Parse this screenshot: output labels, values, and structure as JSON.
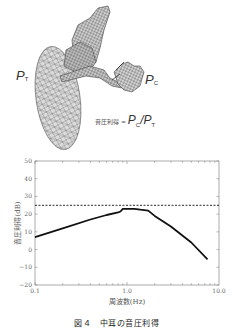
{
  "figure": {
    "caption": "図４　中耳の音圧利得",
    "model_labels": {
      "pt": {
        "main": "P",
        "sub": "T"
      },
      "pc": {
        "main": "P",
        "sub": "C"
      },
      "formula_prefix": "音圧利得 = ",
      "formula_num": {
        "main": "P",
        "sub": "C"
      },
      "formula_sep": "/",
      "formula_den": {
        "main": "P",
        "sub": "T"
      }
    }
  },
  "chart_data": {
    "type": "line",
    "title": "",
    "xlabel": "周波数(Hz)",
    "ylabel": "音圧利得(dB)",
    "xscale": "log",
    "xlim": [
      0.1,
      10.0
    ],
    "ylim": [
      -20,
      50
    ],
    "xticks": [
      "0.1",
      "1.0",
      "10.0"
    ],
    "yticks": [
      "50",
      "40",
      "30",
      "20",
      "10",
      "0",
      "-10",
      "-20"
    ],
    "grid": false,
    "series": [
      {
        "name": "middle-ear gain",
        "style": "solid",
        "x": [
          0.1,
          0.2,
          0.4,
          0.6,
          0.8,
          0.85,
          0.9,
          1.0,
          1.2,
          1.4,
          1.7,
          2.0,
          3.0,
          5.0,
          7.5
        ],
        "y": [
          7.0,
          12.0,
          17.0,
          19.5,
          21.0,
          21.5,
          23.0,
          23.0,
          23.0,
          22.5,
          22.0,
          19.0,
          13.0,
          4.0,
          -5.5
        ]
      },
      {
        "name": "reference",
        "style": "dashed",
        "x": [
          0.1,
          10.0
        ],
        "y": [
          25,
          25
        ]
      }
    ]
  }
}
